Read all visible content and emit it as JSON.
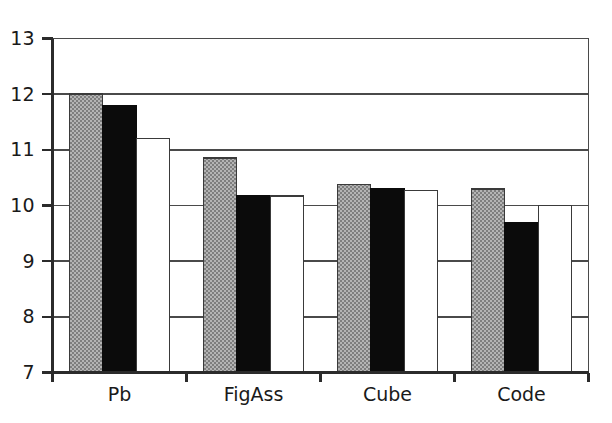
{
  "chart_data": {
    "type": "bar",
    "title": "",
    "subtitle": "",
    "xlabel": "",
    "ylabel": "",
    "categories": [
      "Pb",
      "FigAss",
      "Cube",
      "Code"
    ],
    "series": [
      {
        "name": "series-1",
        "style": "gray",
        "color": "#9a9a9a",
        "values": [
          12.0,
          10.85,
          10.38,
          10.3
        ]
      },
      {
        "name": "series-2",
        "style": "black",
        "color": "#0b0b0b",
        "values": [
          11.8,
          10.17,
          10.3,
          9.7
        ]
      },
      {
        "name": "series-3",
        "style": "white",
        "color": "#ffffff",
        "values": [
          11.2,
          10.17,
          10.27,
          10.0
        ]
      }
    ],
    "ylim": [
      7,
      13
    ],
    "yticks": [
      7,
      8,
      9,
      10,
      11,
      12,
      13
    ],
    "ytick_labels": [
      "7",
      "8",
      "9",
      "10",
      "11",
      "12",
      "13"
    ],
    "grid": true,
    "grid_axis": "y",
    "legend": false,
    "legend_position": "none",
    "annotations": []
  },
  "axis": {
    "y_label_texts": [
      "13",
      "12",
      "11",
      "10",
      "9",
      "8",
      "7"
    ],
    "x_label_texts": [
      "Pb",
      "FigAss",
      "Cube",
      "Code"
    ]
  }
}
